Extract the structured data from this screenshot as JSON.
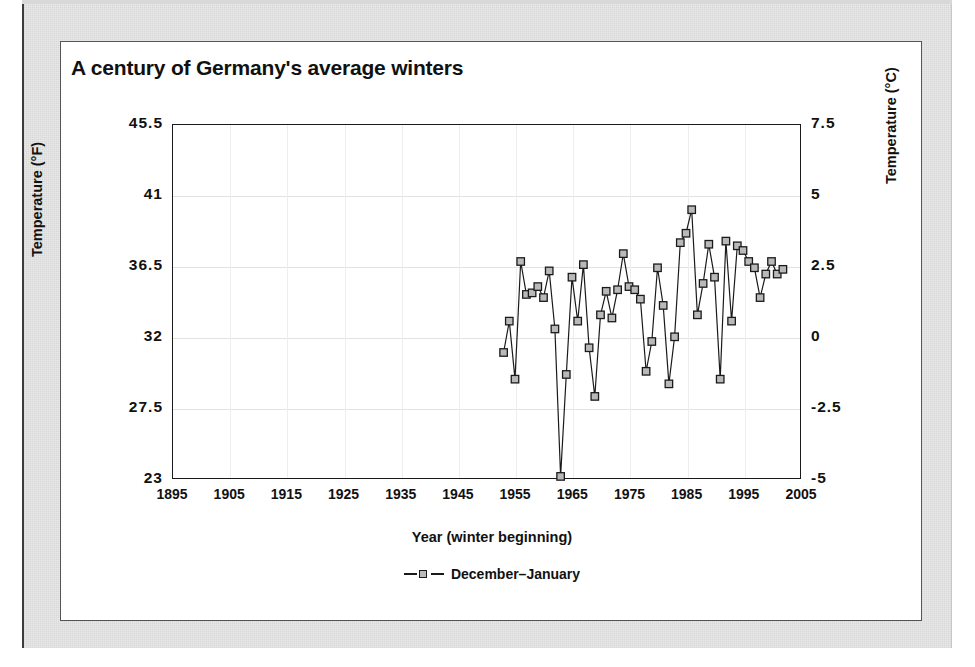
{
  "figure": {
    "title": "A century of Germany's average winters"
  },
  "axes": {
    "x_title": "Year (winter beginning)",
    "y_left_title": "Temperature (°F)",
    "y_right_title": "Temperature (°C)",
    "x_ticks": [
      "1895",
      "1905",
      "1915",
      "1925",
      "1935",
      "1945",
      "1955",
      "1965",
      "1975",
      "1985",
      "1995",
      "2005"
    ],
    "y_left_ticks": [
      "45.5",
      "41",
      "36.5",
      "32",
      "27.5",
      "23"
    ],
    "y_right_ticks": [
      "7.5",
      "5",
      "2.5",
      "0",
      "-2.5",
      "-5"
    ]
  },
  "legend": {
    "position": "bottom-center",
    "entries": [
      {
        "label": "December–January",
        "marker": "square",
        "marker_fill": "#b9b9b9",
        "marker_stroke": "#1a1a1a"
      }
    ]
  },
  "colors": {
    "line": "#1a1a1a",
    "marker_fill": "#b9b9b9",
    "frame": "#1a1a1a",
    "grid": "#e2e2e2",
    "mat": "#e9e9e9",
    "card": "#ffffff",
    "text": "#111111"
  },
  "chart_data": {
    "type": "line",
    "title": "A century of Germany's average winters",
    "xlabel": "Year (winter beginning)",
    "ylabel": "Temperature (°F)",
    "ylabel_secondary": "Temperature (°C)",
    "xlim": [
      1895,
      2005
    ],
    "ylim": [
      23,
      45.5
    ],
    "ylim_secondary": [
      -5,
      7.5
    ],
    "grid": true,
    "legend": [
      "December–January"
    ],
    "x": [
      1953,
      1954,
      1955,
      1956,
      1957,
      1958,
      1959,
      1960,
      1961,
      1962,
      1963,
      1964,
      1965,
      1966,
      1967,
      1968,
      1969,
      1970,
      1971,
      1972,
      1973,
      1974,
      1975,
      1976,
      1977,
      1978,
      1979,
      1980,
      1981,
      1982,
      1983,
      1984,
      1985,
      1986,
      1987,
      1988,
      1989,
      1990,
      1991,
      1992,
      1993,
      1994,
      1995,
      1996,
      1997,
      1998,
      1999,
      2000,
      2001,
      2002
    ],
    "series": [
      {
        "name": "December–January",
        "unit": "°F",
        "values": [
          31.0,
          33.0,
          29.3,
          36.8,
          34.7,
          34.8,
          35.2,
          34.5,
          36.2,
          32.5,
          23.1,
          29.6,
          35.8,
          33.0,
          36.6,
          31.3,
          28.2,
          33.4,
          34.9,
          33.2,
          35.0,
          37.3,
          35.2,
          35.0,
          34.4,
          29.8,
          31.7,
          36.4,
          34.0,
          29.0,
          32.0,
          38.0,
          38.6,
          40.1,
          33.4,
          35.4,
          37.9,
          35.8,
          29.3,
          38.1,
          33.0,
          37.8,
          37.5,
          36.8,
          36.4,
          34.5,
          36.0,
          36.8,
          36.0,
          36.3
        ]
      }
    ]
  }
}
